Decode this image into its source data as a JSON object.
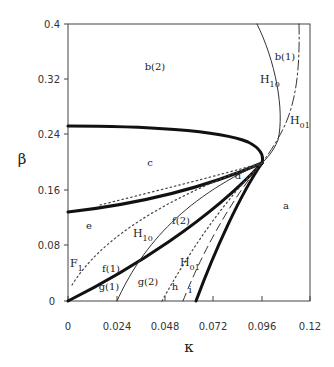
{
  "figure": {
    "type": "bifurcation-diagram",
    "xlabel": "κ",
    "ylabel": "β",
    "x_ticks": [
      "0",
      "0.024",
      "0.048",
      "0.072",
      "0.096",
      "0.12"
    ],
    "y_ticks": [
      "0",
      "0.08",
      "0.16",
      "0.24",
      "0.32",
      "0.4"
    ],
    "xlim": [
      0,
      0.12
    ],
    "ylim": [
      0,
      0.4
    ],
    "region_labels": {
      "a": "a",
      "b1": "b(1)",
      "b2": "b(2)",
      "c": "c",
      "d": "d",
      "e": "e",
      "f1": "f(1)",
      "f2": "f(2)",
      "g1": "g(1)",
      "g2": "g(2)",
      "h": "h",
      "i": "i"
    },
    "curve_labels": {
      "H10_upper": {
        "main": "H",
        "sub": "10"
      },
      "H01_upper": {
        "main": "H",
        "sub": "01"
      },
      "H10_lower": {
        "main": "H",
        "sub": "10"
      },
      "H01_lower": {
        "main": "H",
        "sub": "01"
      },
      "F1": {
        "main": "F",
        "sub": "1"
      }
    },
    "convergence_point": {
      "kappa": 0.096,
      "beta": 0.198
    }
  }
}
